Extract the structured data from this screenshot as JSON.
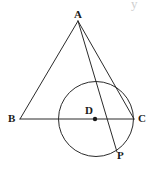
{
  "figure": {
    "background_color": "#ffffff",
    "stroke_color": "#2b2b2b",
    "label_color": "#1a1a1a",
    "width": 154,
    "height": 169,
    "artifact_glyph": "y"
  },
  "labels": {
    "a": "A",
    "b": "B",
    "c": "C",
    "d": "D",
    "p": "P"
  },
  "geometry": {
    "points": {
      "A": {
        "x": 78,
        "y": 21,
        "label": "A",
        "label_x": 74,
        "label_y": 9
      },
      "B": {
        "x": 20,
        "y": 119,
        "label": "B",
        "label_x": 8,
        "label_y": 113
      },
      "C": {
        "x": 134,
        "y": 119,
        "label": "C",
        "label_x": 138,
        "label_y": 113
      },
      "D": {
        "x": 95,
        "y": 119,
        "label": "D",
        "label_x": 85,
        "label_y": 105
      },
      "P": {
        "x": 117,
        "y": 152,
        "label": "P",
        "label_x": 117,
        "label_y": 150
      }
    },
    "circle": {
      "cx": 96,
      "cy": 119,
      "r": 37.5
    },
    "segments": [
      {
        "name": "AB",
        "from": "A",
        "to": "B"
      },
      {
        "name": "AC",
        "from": "A",
        "to": "C"
      },
      {
        "name": "AP",
        "from": "A",
        "to": "P"
      },
      {
        "name": "BC",
        "from": "B",
        "to": "C"
      }
    ],
    "center_dot_radius": 2.2
  }
}
